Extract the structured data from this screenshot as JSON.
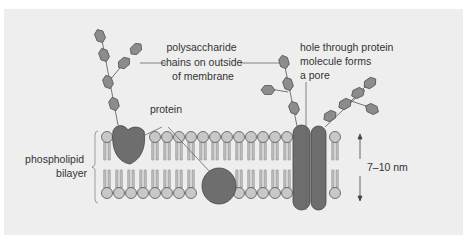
{
  "diagram": {
    "labels": {
      "polysaccharide": [
        "polysaccharide",
        "chains on outside",
        "of membrane"
      ],
      "protein": "protein",
      "pore": [
        "hole through protein",
        "molecule forms",
        "a pore"
      ],
      "bilayer": [
        "phospholipid",
        "bilayer"
      ],
      "thickness": "7–10 nm"
    },
    "colors": {
      "background": "#eeeeee",
      "phospholipid_head": "#c8c8c8",
      "protein": "#6e6e6e",
      "sugar": "#8c8c8c",
      "line": "#555555"
    }
  }
}
